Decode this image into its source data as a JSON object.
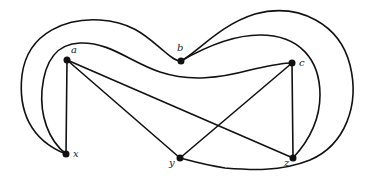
{
  "diagram": {
    "type": "graph",
    "nodes": [
      {
        "id": "a",
        "label": "a",
        "x": 67,
        "y": 60
      },
      {
        "id": "b",
        "label": "b",
        "x": 181,
        "y": 61
      },
      {
        "id": "c",
        "label": "c",
        "x": 292,
        "y": 63
      },
      {
        "id": "x",
        "label": "x",
        "x": 66,
        "y": 154
      },
      {
        "id": "y",
        "label": "y",
        "x": 180,
        "y": 158
      },
      {
        "id": "z",
        "label": "z",
        "x": 293,
        "y": 158
      }
    ],
    "edges": [
      {
        "from": "a",
        "to": "x",
        "style": "straight"
      },
      {
        "from": "a",
        "to": "y",
        "style": "straight"
      },
      {
        "from": "a",
        "to": "z",
        "style": "straight"
      },
      {
        "from": "c",
        "to": "y",
        "style": "straight"
      },
      {
        "from": "c",
        "to": "z",
        "style": "straight"
      },
      {
        "from": "x",
        "to": "b",
        "style": "curved-outer-left"
      },
      {
        "from": "x",
        "to": "c",
        "style": "curved-inner-left"
      },
      {
        "from": "b",
        "to": "y",
        "style": "curved-outer-right"
      },
      {
        "from": "b",
        "to": "z",
        "style": "curved-inner-right"
      }
    ],
    "colors": {
      "stroke": "#111111",
      "node": "#111111",
      "background": "#ffffff"
    }
  }
}
